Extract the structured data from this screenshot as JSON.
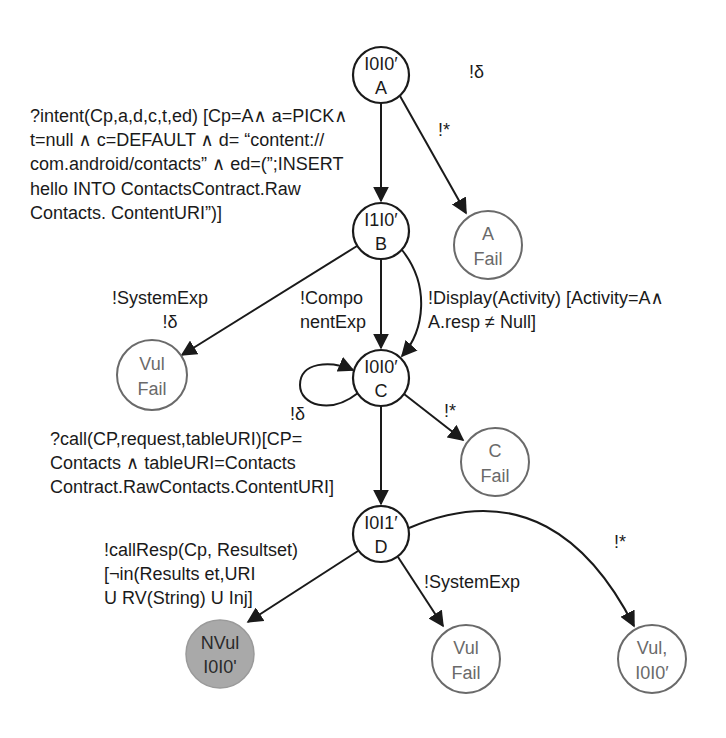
{
  "diagram": {
    "type": "state-transition-graph",
    "nodes": {
      "A": {
        "line1": "I0I0′",
        "line2": "A",
        "kind": "state"
      },
      "B": {
        "line1": "I1I0′",
        "line2": "B",
        "kind": "state"
      },
      "C": {
        "line1": "I0I0′",
        "line2": "C",
        "kind": "state"
      },
      "D": {
        "line1": "I0I1′",
        "line2": "D",
        "kind": "state"
      },
      "a_fail": {
        "line1": "A",
        "line2": "Fail",
        "kind": "terminal"
      },
      "vul_fail_b": {
        "line1": "Vul",
        "line2": "Fail",
        "kind": "terminal"
      },
      "c_fail": {
        "line1": "C",
        "line2": "Fail",
        "kind": "terminal"
      },
      "nvul": {
        "line1": "NVul",
        "line2": "I0I0'",
        "kind": "safe-terminal"
      },
      "vul_fail_d": {
        "line1": "Vul",
        "line2": "Fail",
        "kind": "terminal"
      },
      "vul_d": {
        "line1": "Vul,",
        "line2": "I0I0′",
        "kind": "terminal"
      }
    },
    "edges": {
      "a_quiescence": {
        "from": "A",
        "to": "A",
        "lines": [
          "!δ"
        ]
      },
      "a_to_b": {
        "from": "A",
        "to": "B",
        "lines": [
          "?intent(Cp,a,d,c,t,ed) [Cp=A∧ a=PICK∧",
          "t=null ∧ c=DEFAULT ∧ d= “content://",
          "com.android/contacts” ∧ ed=(”;INSERT",
          "hello INTO ContactsContract.Raw",
          "Contacts. ContentURI”)]"
        ]
      },
      "a_to_fail": {
        "from": "A",
        "to": "a_fail",
        "lines": [
          "!*"
        ]
      },
      "b_to_vul": {
        "from": "B",
        "to": "vul_fail_b",
        "lines": [
          "!SystemExp",
          "!δ"
        ]
      },
      "b_to_c_component": {
        "from": "B",
        "to": "C",
        "lines": [
          "!Compo",
          "nentExp"
        ]
      },
      "b_to_c_display": {
        "from": "B",
        "to": "C",
        "lines": [
          "!Display(Activity) [Activity=A∧",
          "A.resp ≠ Null]"
        ]
      },
      "c_self": {
        "from": "C",
        "to": "C",
        "lines": [
          "!δ"
        ]
      },
      "c_to_fail": {
        "from": "C",
        "to": "c_fail",
        "lines": [
          "!*"
        ]
      },
      "c_to_d": {
        "from": "C",
        "to": "D",
        "lines": [
          "?call(CP,request,tableURI)[CP=",
          "Contacts ∧ tableURI=Contacts",
          "Contract.RawContacts.ContentURI]"
        ]
      },
      "d_to_nvul": {
        "from": "D",
        "to": "nvul",
        "lines": [
          "!callResp(Cp, Resultset)",
          "[¬in(Results et,URI",
          "U RV(String) U Inj]"
        ]
      },
      "d_to_vul_fail": {
        "from": "D",
        "to": "vul_fail_d",
        "lines": [
          "!SystemExp"
        ]
      },
      "d_to_vul": {
        "from": "D",
        "to": "vul_d",
        "lines": [
          "!*"
        ]
      }
    },
    "colors": {
      "stroke_main": "#1a1a1a",
      "stroke_terminal": "#6a6a6a",
      "fill_safe": "#a9a9a9",
      "background": "#ffffff"
    }
  }
}
